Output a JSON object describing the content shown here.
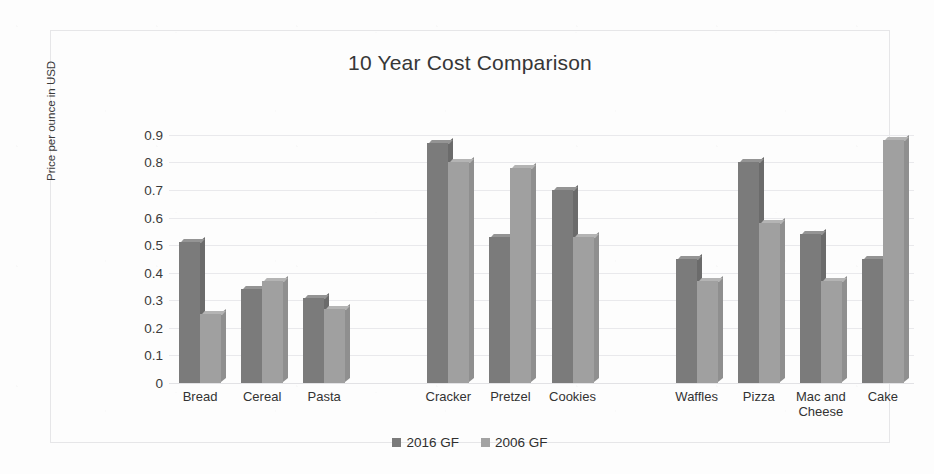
{
  "chart_data": {
    "type": "bar",
    "title": "10 Year Cost Comparison",
    "xlabel": "",
    "ylabel": "Price per ounce in USD",
    "ylim": [
      0,
      0.9
    ],
    "ytick_labels": [
      "0.9",
      "0.8",
      "0.7",
      "0.6",
      "0.5",
      "0.4",
      "0.3",
      "0.2",
      "0.1",
      "0"
    ],
    "ytick_values": [
      0.9,
      0.8,
      0.7,
      0.6,
      0.5,
      0.4,
      0.3,
      0.2,
      0.1,
      0
    ],
    "grid": true,
    "legend_position": "bottom",
    "categories": [
      "Bread",
      "Cereal",
      "Pasta",
      "",
      "Cracker",
      "Pretzel",
      "Cookies",
      "",
      "Waffles",
      "Pizza",
      "Mac and Cheese",
      "Cake"
    ],
    "series": [
      {
        "name": "2016 GF",
        "color": "#7b7b7b",
        "values": [
          0.51,
          0.34,
          0.31,
          null,
          0.87,
          0.53,
          0.7,
          null,
          0.45,
          0.8,
          0.54,
          0.45
        ]
      },
      {
        "name": "2006 GF",
        "color": "#a0a0a0",
        "values": [
          0.25,
          0.37,
          0.27,
          null,
          0.8,
          0.78,
          0.53,
          null,
          0.37,
          0.58,
          0.37,
          0.88
        ]
      }
    ]
  },
  "legend": {
    "items": [
      {
        "label": "2016 GF",
        "swatch_class": "sw-2016"
      },
      {
        "label": "2006 GF",
        "swatch_class": "sw-2006"
      }
    ]
  }
}
